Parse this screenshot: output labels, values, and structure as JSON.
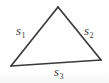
{
  "figure": {
    "kind": "triangle-diagram",
    "background_color": "#ffffff",
    "stroke_color": "#3b3b3b",
    "label_color": "#3b3b3b",
    "width": 109,
    "height": 83,
    "vertices": {
      "apex": {
        "x": 58,
        "y": 7
      },
      "bottom_left": {
        "x": 11,
        "y": 66
      },
      "bottom_right": {
        "x": 101,
        "y": 60
      }
    },
    "sides": [
      {
        "id": "s1",
        "name": "left-side",
        "symbol": "s",
        "subscript": "1",
        "from": "bottom_left",
        "to": "apex",
        "label_x": 16,
        "label_y": 24
      },
      {
        "id": "s2",
        "name": "right-side",
        "symbol": "s",
        "subscript": "2",
        "from": "apex",
        "to": "bottom_right",
        "label_x": 84,
        "label_y": 24
      },
      {
        "id": "s3",
        "name": "bottom-side",
        "symbol": "s",
        "subscript": "3",
        "from": "bottom_left",
        "to": "bottom_right",
        "label_x": 54,
        "label_y": 65
      }
    ]
  }
}
